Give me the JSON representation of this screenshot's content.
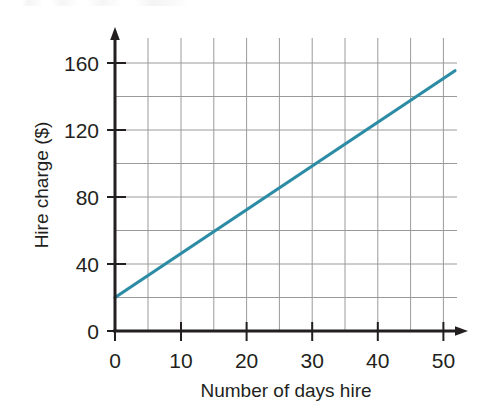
{
  "figure": {
    "name": "hire-charge-line-graph",
    "background_color": "#ffffff",
    "top_crop_artifact": ""
  },
  "chart_data": {
    "type": "line",
    "title": "",
    "xlabel": "Number of days hire",
    "ylabel": "Hire charge ($)",
    "xlim": [
      0,
      52
    ],
    "ylim": [
      0,
      168
    ],
    "grid": true,
    "grid_color": "#9a9a9a",
    "legend": "none",
    "axis_color": "#231f20",
    "series": [
      {
        "name": "Hire charge",
        "color": "#2d8ca5",
        "x": [
          0,
          5,
          10,
          15,
          20,
          25,
          30,
          35,
          40,
          45,
          50
        ],
        "values": [
          20,
          33,
          46,
          59,
          72,
          85,
          98,
          111,
          124,
          137,
          150
        ],
        "intercept": 20,
        "slope": 2.6,
        "endpoint_start": [
          0,
          20
        ],
        "endpoint_end": [
          50,
          150
        ]
      }
    ],
    "x_ticks": [
      0,
      10,
      20,
      30,
      40,
      50
    ],
    "x_tick_labels": [
      "0",
      "10",
      "20",
      "30",
      "40",
      "50"
    ],
    "x_minor_step": 5,
    "y_ticks": [
      0,
      40,
      80,
      120,
      160
    ],
    "y_tick_labels": [
      "0",
      "40",
      "80",
      "120",
      "160"
    ],
    "y_minor_step": 20
  },
  "axes": {
    "y_axis_label": "Hire charge ($)",
    "x_axis_label": "Number of days hire",
    "y_tick_labels": [
      "160",
      "120",
      "80",
      "40",
      "0"
    ],
    "x_tick_labels": [
      "0",
      "10",
      "20",
      "30",
      "40",
      "50"
    ],
    "arrow_x_name": "x-axis-arrow",
    "arrow_y_name": "y-axis-arrow"
  }
}
